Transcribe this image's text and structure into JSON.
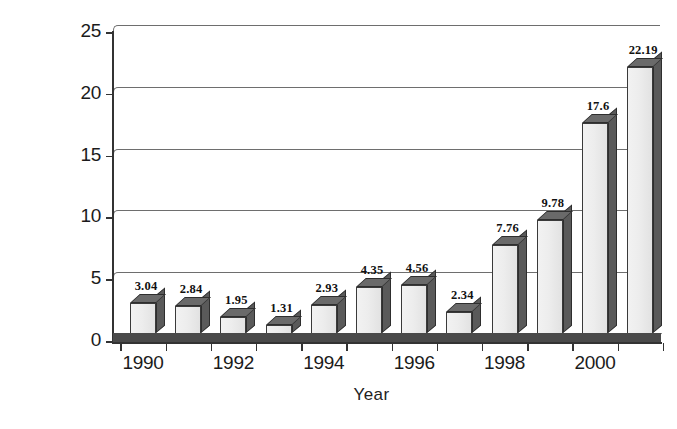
{
  "chart_data": {
    "type": "bar",
    "title": "",
    "subtitle": "",
    "xlabel": "Year",
    "ylabel": "Incidence rate per 1000 births",
    "ylabel_lines": [
      "Incidence rate per 1000",
      "births"
    ],
    "categories": [
      1990,
      1991,
      1992,
      1993,
      1994,
      1995,
      1996,
      1997,
      1998,
      1999,
      2000,
      2001
    ],
    "values": [
      3.04,
      2.84,
      1.95,
      1.31,
      2.93,
      4.35,
      4.56,
      2.34,
      7.76,
      9.78,
      17.6,
      22.19
    ],
    "value_labels": [
      "3.04",
      "2.84",
      "1.95",
      "1.31",
      "2.93",
      "4.35",
      "4.56",
      "2.34",
      "7.76",
      "9.78",
      "17.6",
      "22.19"
    ],
    "ylim": [
      0,
      25
    ],
    "ytick_values": [
      0,
      5,
      10,
      15,
      20,
      25
    ],
    "ytick_labels": [
      "0",
      "5",
      "10",
      "15",
      "20",
      "25"
    ],
    "xtick_labels": [
      "1990",
      "1992",
      "1994",
      "1996",
      "1998",
      "2000"
    ],
    "xtick_values": [
      1990,
      1992,
      1994,
      1996,
      1998,
      2000
    ],
    "grid": true,
    "grid_axis": "y",
    "legend": false,
    "legend_position": "none",
    "style": "3d-grayscale",
    "colors": {
      "bar_front": "#ededed",
      "bar_side": "#5a5a5a",
      "bar_top": "#6a6a6a",
      "bar_outline": "#3a3a3a",
      "floor": "#4a4a4a",
      "gridline": "#6e6e6e",
      "axis": "#333333",
      "text": "#1b1b1b",
      "background": "#ffffff"
    }
  }
}
